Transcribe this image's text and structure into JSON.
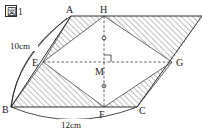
{
  "figure": {
    "caption_box_char": "図",
    "caption_number": "1",
    "caption_full": "図1"
  },
  "vertices": [
    {
      "id": "A",
      "label": "A",
      "x": 71,
      "y": 16,
      "label_x": 66,
      "label_y": 13
    },
    {
      "id": "H",
      "label": "H",
      "x": 104,
      "y": 16,
      "label_x": 100,
      "label_y": 13
    },
    {
      "id": "D",
      "label": "",
      "x": 202,
      "y": 16,
      "label_x": 0,
      "label_y": 0
    },
    {
      "id": "E",
      "label": "E",
      "x": 43,
      "y": 62,
      "label_x": 32,
      "label_y": 66
    },
    {
      "id": "M",
      "label": "M",
      "x": 104,
      "y": 62,
      "label_x": 96,
      "label_y": 74
    },
    {
      "id": "G",
      "label": "G",
      "x": 172,
      "y": 62,
      "label_x": 176,
      "label_y": 66
    },
    {
      "id": "B",
      "label": "B",
      "x": 11,
      "y": 107,
      "label_x": 2,
      "label_y": 112
    },
    {
      "id": "F",
      "label": "F",
      "x": 104,
      "y": 107,
      "label_x": 99,
      "label_y": 117
    },
    {
      "id": "C",
      "label": "C",
      "x": 137,
      "y": 107,
      "label_x": 139,
      "label_y": 113
    }
  ],
  "dimensions": [
    {
      "id": "side-BA",
      "label": "10cm",
      "label_x": 12,
      "label_y": 47,
      "from": "B",
      "to": "A"
    },
    {
      "id": "side-BC",
      "label": "12cm",
      "label_x": 63,
      "label_y": 127,
      "from": "B",
      "to": "C"
    }
  ],
  "marks": {
    "right_angle": {
      "at": "M",
      "symbol": "right-angle"
    },
    "equal_ticks": [
      {
        "on": "HM",
        "symbol": "circle-tick"
      },
      {
        "on": "MF",
        "symbol": "circle-tick"
      }
    ]
  },
  "shapes": {
    "parallelogram": {
      "name": "ABCD",
      "vertices": [
        "A",
        "B",
        "C",
        "D"
      ]
    },
    "rhombus": {
      "name": "EHGF",
      "vertices": [
        "E",
        "H",
        "G",
        "F"
      ],
      "center": "M"
    },
    "diagonals": [
      {
        "name": "EG",
        "style": "dashed"
      },
      {
        "name": "HF",
        "style": "dashed"
      }
    ],
    "hatched_regions": [
      {
        "name": "triangle-AEH",
        "vertices": [
          "A",
          "E",
          "H"
        ]
      },
      {
        "name": "triangle-BEF",
        "vertices": [
          "B",
          "E",
          "F"
        ]
      },
      {
        "name": "region-HDG",
        "vertices": [
          "H",
          "D",
          "G"
        ]
      },
      {
        "name": "triangle-FGC",
        "vertices": [
          "F",
          "G",
          "C"
        ]
      }
    ]
  },
  "colors": {
    "line": "#1a1a1a",
    "dashed": "#3a3a3a",
    "hatch": "#555555",
    "background": "#ffffff"
  }
}
